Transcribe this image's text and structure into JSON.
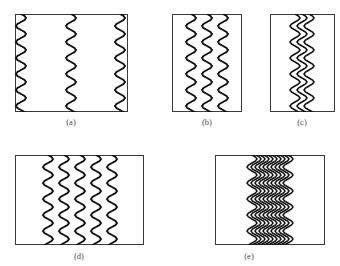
{
  "figure": {
    "top_cropped_text": "",
    "background_color": "#ffffff",
    "line_color": "#111111",
    "box_border_color": "#3a3a3a",
    "label_color": "#4a4a4a",
    "panel_count": 5
  },
  "panels": [
    {
      "id": "a",
      "label": "(a)",
      "box": {
        "x": 15,
        "y": 14,
        "w": 113,
        "h": 98
      },
      "label_pos": {
        "x": 71,
        "y": 117
      },
      "wave_count": 3,
      "wave_spacing_px": 44,
      "wavelength_px": 16,
      "amplitude_px": 5,
      "wave_x_positions": [
        21,
        71,
        120
      ],
      "description": "three widely separated wavy vertical lines"
    },
    {
      "id": "b",
      "label": "(b)",
      "box": {
        "x": 172,
        "y": 14,
        "w": 70,
        "h": 98
      },
      "label_pos": {
        "x": 207,
        "y": 117
      },
      "wave_count": 3,
      "wave_spacing_px": 16,
      "wavelength_px": 16,
      "amplitude_px": 5,
      "wave_x_positions": [
        191,
        207,
        223
      ],
      "description": "three moderately spaced wavy vertical lines near centre"
    },
    {
      "id": "c",
      "label": "(c)",
      "box": {
        "x": 270,
        "y": 14,
        "w": 65,
        "h": 98
      },
      "label_pos": {
        "x": 302,
        "y": 117
      },
      "wave_count": 3,
      "wave_spacing_px": 7,
      "wavelength_px": 16,
      "amplitude_px": 5,
      "wave_x_positions": [
        295,
        302,
        309
      ],
      "description": "three tightly clustered wavy vertical lines at centre"
    },
    {
      "id": "d",
      "label": "(d)",
      "box": {
        "x": 15,
        "y": 155,
        "w": 129,
        "h": 90
      },
      "label_pos": {
        "x": 79,
        "y": 251
      },
      "wave_count": 5,
      "wave_spacing_px": 16,
      "wavelength_px": 16,
      "amplitude_px": 5,
      "wave_x_positions": [
        48,
        64,
        80,
        96,
        112
      ],
      "description": "five evenly spaced wavy vertical lines in left-of-centre band"
    },
    {
      "id": "e",
      "label": "(e)",
      "box": {
        "x": 215,
        "y": 155,
        "w": 110,
        "h": 90
      },
      "label_pos": {
        "x": 249,
        "y": 251
      },
      "wave_count": 10,
      "wave_spacing_px": 4,
      "wavelength_px": 16,
      "amplitude_px": 5,
      "wave_x_positions": [
        252,
        256,
        260,
        264,
        268,
        272,
        276,
        280,
        284,
        288
      ],
      "description": "ten densely packed wavy vertical lines forming a narrow band"
    }
  ]
}
